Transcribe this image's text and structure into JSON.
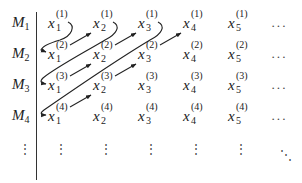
{
  "rows": [
    {
      "label": "M",
      "index": "1"
    },
    {
      "label": "M",
      "index": "2"
    },
    {
      "label": "M",
      "index": "3"
    },
    {
      "label": "M",
      "index": "4"
    }
  ],
  "cells": [
    [
      {
        "var": "x",
        "sub": "1",
        "sup": "(1)"
      },
      {
        "var": "x",
        "sub": "2",
        "sup": "(1)"
      },
      {
        "var": "x",
        "sub": "3",
        "sup": "(1)"
      },
      {
        "var": "x",
        "sub": "4",
        "sup": "(1)"
      },
      {
        "var": "x",
        "sub": "5",
        "sup": "(1)"
      }
    ],
    [
      {
        "var": "x",
        "sub": "1",
        "sup": "(2)"
      },
      {
        "var": "x",
        "sub": "2",
        "sup": "(2)"
      },
      {
        "var": "x",
        "sub": "3",
        "sup": "(2)"
      },
      {
        "var": "x",
        "sub": "4",
        "sup": "(2)"
      },
      {
        "var": "x",
        "sub": "5",
        "sup": "(2)"
      }
    ],
    [
      {
        "var": "x",
        "sub": "1",
        "sup": "(3)"
      },
      {
        "var": "x",
        "sub": "2",
        "sup": "(3)"
      },
      {
        "var": "x",
        "sub": "3",
        "sup": "(3)"
      },
      {
        "var": "x",
        "sub": "4",
        "sup": "(3)"
      },
      {
        "var": "x",
        "sub": "5",
        "sup": "(3)"
      }
    ],
    [
      {
        "var": "x",
        "sub": "1",
        "sup": "(4)"
      },
      {
        "var": "x",
        "sub": "2",
        "sup": "(4)"
      },
      {
        "var": "x",
        "sub": "3",
        "sup": "(4)"
      },
      {
        "var": "x",
        "sub": "4",
        "sup": "(4)"
      },
      {
        "var": "x",
        "sub": "5",
        "sup": "(4)"
      }
    ]
  ],
  "ellipsis": {
    "horizontal": "···",
    "vertical": "⋮",
    "diagonal": "⋱"
  },
  "traversal_order": [
    "x1(1)",
    "x1(2)",
    "x2(1)",
    "x1(3)",
    "x2(2)",
    "x3(1)",
    "x1(4)",
    "x2(3)",
    "x3(2)",
    "x4(1)"
  ],
  "colors": {
    "ink": "#222222",
    "arrow": "#222222",
    "background": "#ffffff"
  }
}
